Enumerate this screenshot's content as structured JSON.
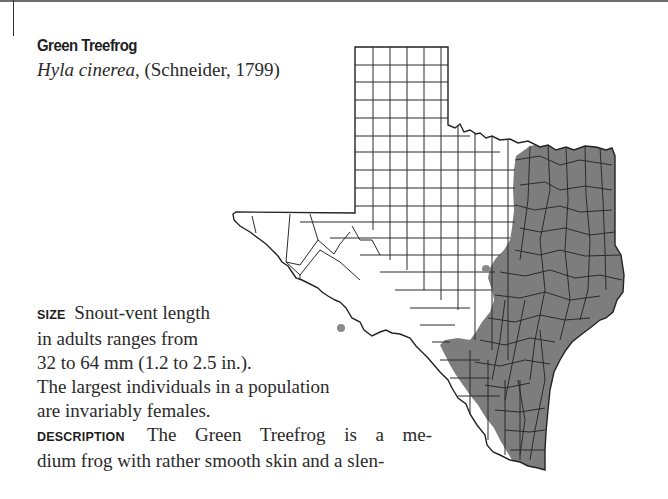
{
  "page": {
    "top_rule": true,
    "margin_tick": true
  },
  "species": {
    "common_name": "Green Treefrog",
    "scientific_name": "Hyla cinerea",
    "authority": ", (Schneider, 1799)"
  },
  "map": {
    "region": "Texas",
    "range_description": "Eastern half of Texas shaded gray (distribution range) plus isolated record dots in the south-central and southwest",
    "colors": {
      "range_fill": "#7d7d7d",
      "county_lines": "#2b2b2b",
      "background": "#ffffff"
    }
  },
  "sections": {
    "size": {
      "label": "SIZE",
      "lines": [
        "Snout-vent length",
        "in adults ranges from",
        "32 to 64 mm (1.2 to 2.5 in.).",
        "The largest individuals in a population",
        "are invariably females."
      ]
    },
    "description": {
      "label": "DESCRIPTION",
      "lines": [
        "The Green Treefrog is a me-",
        "dium frog with rather smooth skin and a slen-"
      ]
    }
  }
}
